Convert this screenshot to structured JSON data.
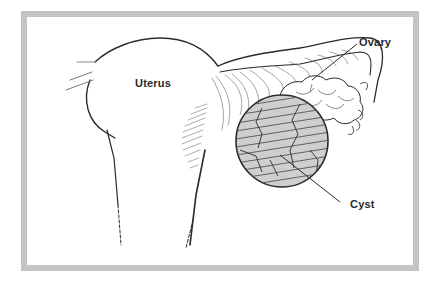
{
  "figure": {
    "frame_color": "#c4c4c4",
    "line_color": "#2a2a2a",
    "cyst_fill": "#cfcfcf",
    "labels": [
      {
        "id": "uterus",
        "text": "Uterus"
      },
      {
        "id": "ovary",
        "text": "Ovary"
      },
      {
        "id": "cyst",
        "text": "Cyst"
      }
    ]
  }
}
